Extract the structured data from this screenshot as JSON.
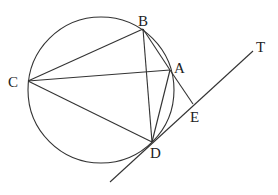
{
  "diagram": {
    "type": "circle-geometry",
    "circle": {
      "cx": 101,
      "cy": 90,
      "r": 73
    },
    "points": {
      "A": {
        "x": 170,
        "y": 70,
        "label": "A",
        "lx": 174,
        "ly": 73
      },
      "B": {
        "x": 143,
        "y": 29,
        "label": "B",
        "lx": 139,
        "ly": 26
      },
      "C": {
        "x": 28,
        "y": 81,
        "label": "C",
        "lx": 8,
        "ly": 87
      },
      "D": {
        "x": 152,
        "y": 142,
        "label": "D",
        "lx": 150,
        "ly": 158
      },
      "E": {
        "x": 193,
        "y": 104,
        "label": "E",
        "lx": 190,
        "ly": 122
      },
      "T": {
        "x": 253,
        "y": 51,
        "label": "T",
        "lx": 256,
        "ly": 51
      }
    },
    "labels": [
      "A",
      "B",
      "C",
      "D",
      "E",
      "T"
    ],
    "segments": [
      [
        "C",
        "B"
      ],
      [
        "C",
        "A"
      ],
      [
        "C",
        "D"
      ],
      [
        "B",
        "D"
      ],
      [
        "B",
        "A"
      ],
      [
        "A",
        "D"
      ],
      [
        "A",
        "E"
      ]
    ],
    "tangent_line": {
      "from": {
        "x": 110,
        "y": 182
      },
      "to": {
        "x": 253,
        "y": 51
      },
      "through": [
        "D",
        "E",
        "T"
      ]
    }
  }
}
